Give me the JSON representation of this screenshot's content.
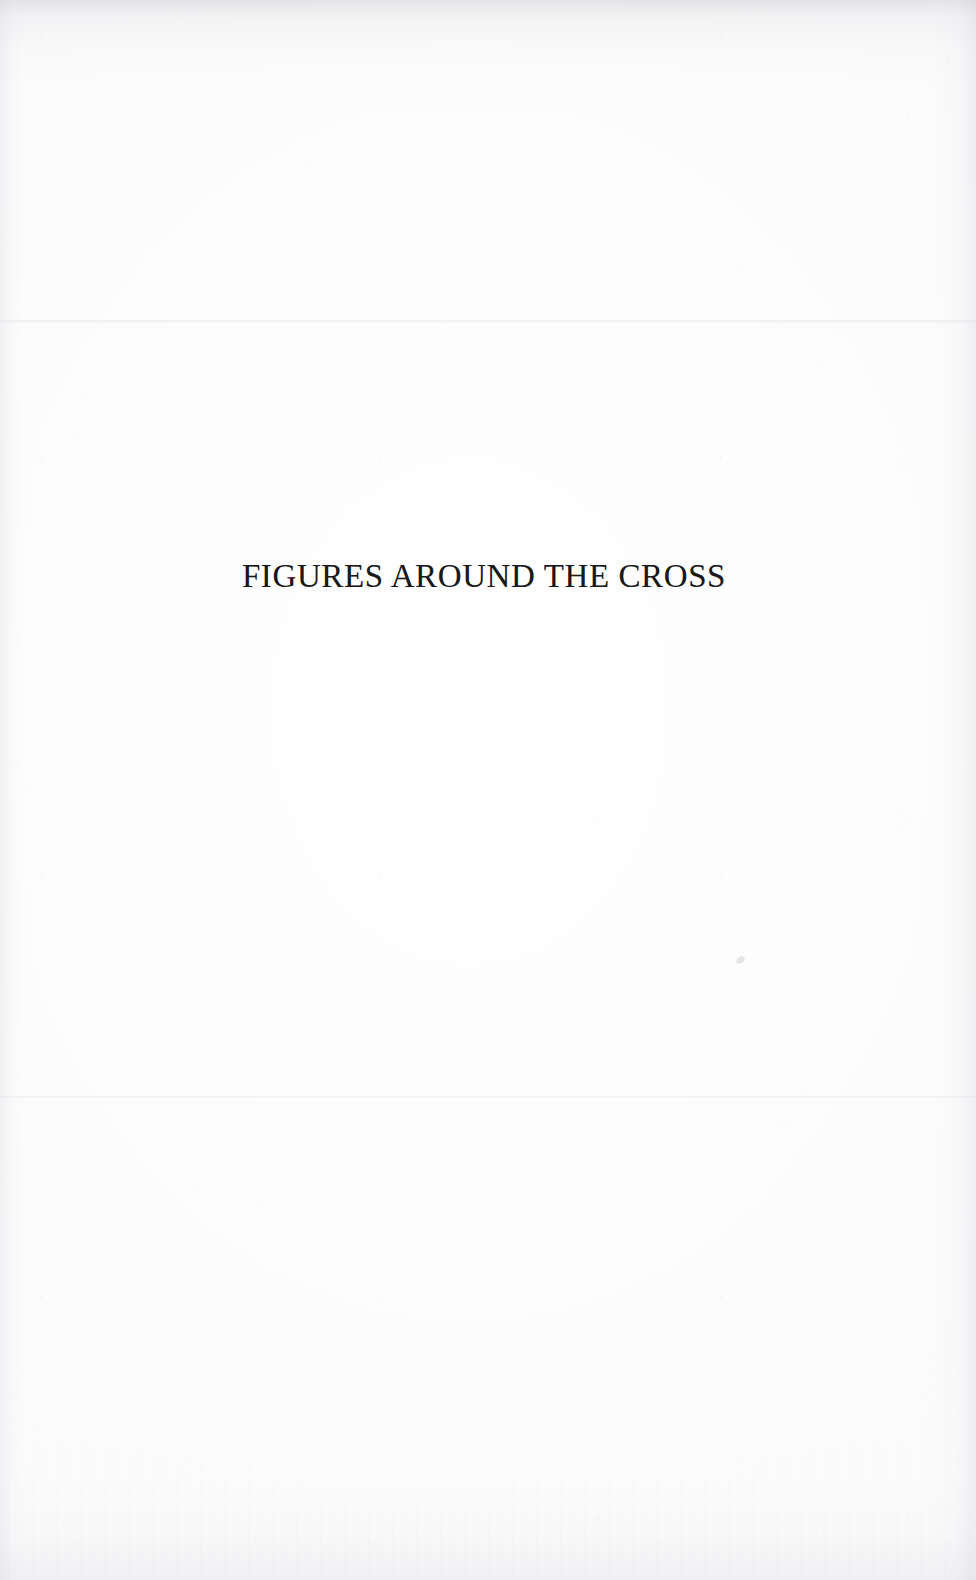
{
  "document": {
    "type": "scanned-book-section-divider",
    "page_background_color": "#fdfdfd",
    "ink_color": "#191919"
  },
  "title": {
    "text": "FIGURES AROUND THE CROSS"
  },
  "artifacts": {
    "upper_scan_line_label": "upper-scan-seam",
    "lower_scan_line_label": "lower-scan-seam",
    "blemish_label": "paper-speck"
  }
}
